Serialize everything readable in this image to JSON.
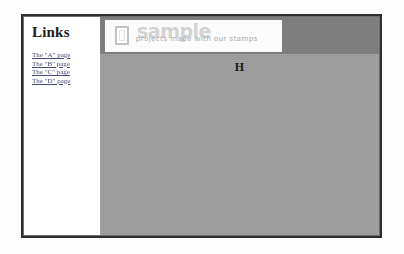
{
  "sidebar": {
    "heading": "Links",
    "links": [
      {
        "label": "The \"A\" page"
      },
      {
        "label": "The \"B\" page"
      },
      {
        "label": "The \"C\" page"
      },
      {
        "label": "The \"D\" page"
      }
    ]
  },
  "banner": {
    "icon": "stamp-frame-icon",
    "wordmark": "sample",
    "tagline": "projects made with our stamps"
  },
  "content": {
    "heading": "H"
  },
  "colors": {
    "page_background": "#ffffff",
    "frame_border": "#2e2e2e",
    "sidebar_background": "#ffffff",
    "content_background": "#9e9e9e",
    "header_band": "#7d7d7d",
    "banner_background": "#fbfbfb",
    "wordmark": "#d3d3d3",
    "tagline": "#a9a9a9",
    "link": "#4a4a7a",
    "heading_text": "#1a1a1a"
  }
}
